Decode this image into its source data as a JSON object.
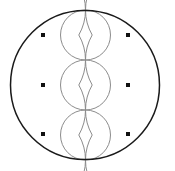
{
  "figure": {
    "kind": "geometric-line-drawing",
    "canvas": {
      "width": 175,
      "height": 171,
      "background_color": "#ffffff"
    },
    "colors": {
      "outer_stroke": "#1a1a1a",
      "inner_stroke": "#8c8c8c",
      "arc_stroke": "#8c8c8c",
      "marker_fill": "#111111"
    },
    "stroke_widths": {
      "outer": 1.5,
      "inner": 1.0,
      "arc": 1.0
    },
    "outer_circle": {
      "name": "bounding-circle",
      "cx": 85,
      "cy": 85,
      "r": 74.5
    },
    "inner_circles": [
      {
        "name": "top-circle",
        "cx": 85.5,
        "cy": 35,
        "r": 25
      },
      {
        "name": "middle-circle",
        "cx": 85.5,
        "cy": 85,
        "r": 25
      },
      {
        "name": "bottom-circle",
        "cx": 85.5,
        "cy": 135,
        "r": 25
      }
    ],
    "petal_arcs": [
      {
        "name": "arc-left-upper",
        "cx": 135.5,
        "cy": 60,
        "r": 50,
        "start_angle": 150,
        "end_angle": 210
      },
      {
        "name": "arc-left-lower",
        "cx": 135.5,
        "cy": 110,
        "r": 50,
        "start_angle": 150,
        "end_angle": 210
      },
      {
        "name": "arc-right-upper",
        "cx": 35.5,
        "cy": 60,
        "r": 50,
        "start_angle": -30,
        "end_angle": 30
      },
      {
        "name": "arc-right-lower",
        "cx": 35.5,
        "cy": 110,
        "r": 50,
        "start_angle": -30,
        "end_angle": 30
      },
      {
        "name": "arc-left-top",
        "cx": 135.5,
        "cy": 10,
        "r": 50,
        "start_angle": 150,
        "end_angle": 210
      },
      {
        "name": "arc-left-bottom",
        "cx": 135.5,
        "cy": 160,
        "r": 50,
        "start_angle": 150,
        "end_angle": 210
      },
      {
        "name": "arc-right-top",
        "cx": 35.5,
        "cy": 10,
        "r": 50,
        "start_angle": -30,
        "end_angle": 30
      },
      {
        "name": "arc-right-bottom",
        "cx": 35.5,
        "cy": 160,
        "r": 50,
        "start_angle": -30,
        "end_angle": 30
      }
    ],
    "node_markers": [
      {
        "name": "node-top-left",
        "cx": 43,
        "cy": 35,
        "size": 4
      },
      {
        "name": "node-top-right",
        "cx": 128,
        "cy": 35,
        "size": 4
      },
      {
        "name": "node-middle-left",
        "cx": 43,
        "cy": 85,
        "size": 4
      },
      {
        "name": "node-middle-right",
        "cx": 128,
        "cy": 85,
        "size": 4
      },
      {
        "name": "node-bottom-left",
        "cx": 43,
        "cy": 134,
        "size": 4
      },
      {
        "name": "node-bottom-right",
        "cx": 128,
        "cy": 134,
        "size": 4
      }
    ]
  }
}
